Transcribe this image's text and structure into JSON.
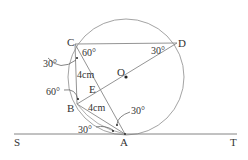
{
  "diagram": {
    "type": "geometry",
    "colors": {
      "line": "#888888",
      "text": "#333333",
      "point": "#222222"
    },
    "circle": {
      "center": "O",
      "cx": 126,
      "cy": 77,
      "r": 58
    },
    "points": {
      "C": {
        "label": "C",
        "x": 75,
        "y": 44
      },
      "D": {
        "label": "D",
        "x": 177,
        "y": 43
      },
      "O": {
        "label": "O",
        "x": 126,
        "y": 77
      },
      "E": {
        "label": "E",
        "x": 95,
        "y": 95
      },
      "B": {
        "label": "B",
        "x": 77,
        "y": 104
      },
      "A": {
        "label": "A",
        "x": 125,
        "y": 134
      },
      "S": {
        "label": "S"
      },
      "T": {
        "label": "T"
      }
    },
    "angles": {
      "c_outer": "30°",
      "c_inner": "60°",
      "d": "30°",
      "b": "60°",
      "a_upper": "30°",
      "a_lower": "30°"
    },
    "lengths": {
      "cb": "4cm",
      "ba": "4cm"
    }
  }
}
